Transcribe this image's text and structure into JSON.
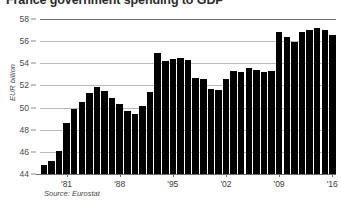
{
  "chart_data": {
    "type": "bar",
    "title": "France government spending to GDP",
    "xlabel": "",
    "ylabel": "EUR billion",
    "ylim": [
      44,
      58
    ],
    "ytick_values": [
      58,
      56,
      54,
      52,
      50,
      48,
      46,
      44
    ],
    "ytick_labels": [
      "58",
      "56",
      "54",
      "52",
      "50",
      "48",
      "46",
      "44"
    ],
    "grid": true,
    "legend": "none",
    "source": "Source: Eurostat",
    "xtick_labels": [
      "'81",
      "'88",
      "'95",
      "'02",
      "'09",
      "'16"
    ],
    "xtick_years": [
      1981,
      1988,
      1995,
      2002,
      2009,
      2016
    ],
    "categories": [
      "1978",
      "1979",
      "1980",
      "1981",
      "1982",
      "1983",
      "1984",
      "1985",
      "1986",
      "1987",
      "1988",
      "1989",
      "1990",
      "1991",
      "1992",
      "1993",
      "1994",
      "1995",
      "1996",
      "1997",
      "1998",
      "1999",
      "2000",
      "2001",
      "2002",
      "2003",
      "2004",
      "2005",
      "2006",
      "2007",
      "2008",
      "2009",
      "2010",
      "2011",
      "2012",
      "2013",
      "2014",
      "2015",
      "2016"
    ],
    "values": [
      44.8,
      45.2,
      46.1,
      48.6,
      49.9,
      50.5,
      51.3,
      51.9,
      51.5,
      50.9,
      50.3,
      49.7,
      49.4,
      50.1,
      51.4,
      54.9,
      54.2,
      54.4,
      54.5,
      54.3,
      52.7,
      52.6,
      51.7,
      51.6,
      52.6,
      53.3,
      53.2,
      53.6,
      53.4,
      53.2,
      53.3,
      56.8,
      56.4,
      55.9,
      56.8,
      57.0,
      57.2,
      57.0,
      56.6
    ],
    "series": [
      {
        "name": "Government spending to GDP",
        "values": [
          44.8,
          45.2,
          46.1,
          48.6,
          49.9,
          50.5,
          51.3,
          51.9,
          51.5,
          50.9,
          50.3,
          49.7,
          49.4,
          50.1,
          51.4,
          54.9,
          54.2,
          54.4,
          54.5,
          54.3,
          52.7,
          52.6,
          51.7,
          51.6,
          52.6,
          53.3,
          53.2,
          53.6,
          53.4,
          53.2,
          53.3,
          56.8,
          56.4,
          55.9,
          56.8,
          57.0,
          57.2,
          57.0,
          56.6
        ],
        "color": "#000000"
      }
    ]
  },
  "colors": {
    "bar": "#000000",
    "gridline": "#b9b9b9",
    "axis": "#6d6d6d",
    "text": "#3b3b3b",
    "background": "#ffffff"
  }
}
